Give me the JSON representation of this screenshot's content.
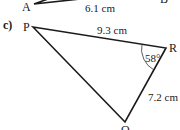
{
  "previous_figure": {
    "vertex_a": "A",
    "vertex_b": "B",
    "side_ab": "6.1 cm"
  },
  "question": {
    "label": "c)",
    "triangle": {
      "vertices": {
        "p": "P",
        "q": "Q",
        "r": "R"
      },
      "side_pr": "9.3 cm",
      "side_rq": "7.2 cm",
      "angle_r": "58°"
    }
  },
  "colors": {
    "line": "#1a1a1a",
    "background": "#ffffff"
  }
}
